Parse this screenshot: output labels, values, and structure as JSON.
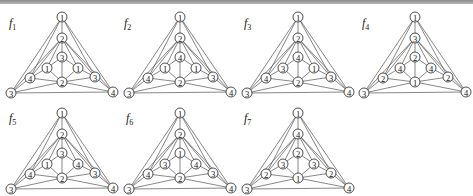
{
  "figure": {
    "graphs": [
      {
        "label": "f",
        "sub": "1",
        "nodes": {
          "top": "1",
          "upper": "2",
          "innerTop": "3",
          "innerLeft": "1",
          "innerRight": "1",
          "midLeft": "4",
          "midRight": "3",
          "bottomCenter": "2",
          "bottomLeft": "3",
          "bottomRight": "4"
        }
      },
      {
        "label": "f",
        "sub": "2",
        "nodes": {
          "top": "1",
          "upper": "2",
          "innerTop": "4",
          "innerLeft": "1",
          "innerRight": "1",
          "midLeft": "4",
          "midRight": "3",
          "bottomCenter": "2",
          "bottomLeft": "3",
          "bottomRight": "4"
        }
      },
      {
        "label": "f",
        "sub": "3",
        "nodes": {
          "top": "1",
          "upper": "2",
          "innerTop": "4",
          "innerLeft": "3",
          "innerRight": "1",
          "midLeft": "4",
          "midRight": "3",
          "bottomCenter": "2",
          "bottomLeft": "3",
          "bottomRight": "4"
        }
      },
      {
        "label": "f",
        "sub": "4",
        "nodes": {
          "top": "1",
          "upper": "3",
          "innerTop": "2",
          "innerLeft": "4",
          "innerRight": "4",
          "midLeft": "2",
          "midRight": "2",
          "bottomCenter": "1",
          "bottomLeft": "3",
          "bottomRight": "4"
        }
      },
      {
        "label": "f",
        "sub": "5",
        "nodes": {
          "top": "1",
          "upper": "2",
          "innerTop": "3",
          "innerLeft": "1",
          "innerRight": "4",
          "midLeft": "4",
          "midRight": "3",
          "bottomCenter": "2",
          "bottomLeft": "3",
          "bottomRight": "4"
        }
      },
      {
        "label": "f",
        "sub": "6",
        "nodes": {
          "top": "1",
          "upper": "2",
          "innerTop": "1",
          "innerLeft": "3",
          "innerRight": "4",
          "midLeft": "4",
          "midRight": "3",
          "bottomCenter": "2",
          "bottomLeft": "3",
          "bottomRight": "4"
        }
      },
      {
        "label": "f",
        "sub": "7",
        "nodes": {
          "top": "1",
          "upper": "4",
          "innerTop": "2",
          "innerLeft": "3",
          "innerRight": "3",
          "midLeft": "2",
          "midRight": "2",
          "bottomCenter": "1",
          "bottomLeft": "3",
          "bottomRight": "4"
        }
      }
    ]
  }
}
